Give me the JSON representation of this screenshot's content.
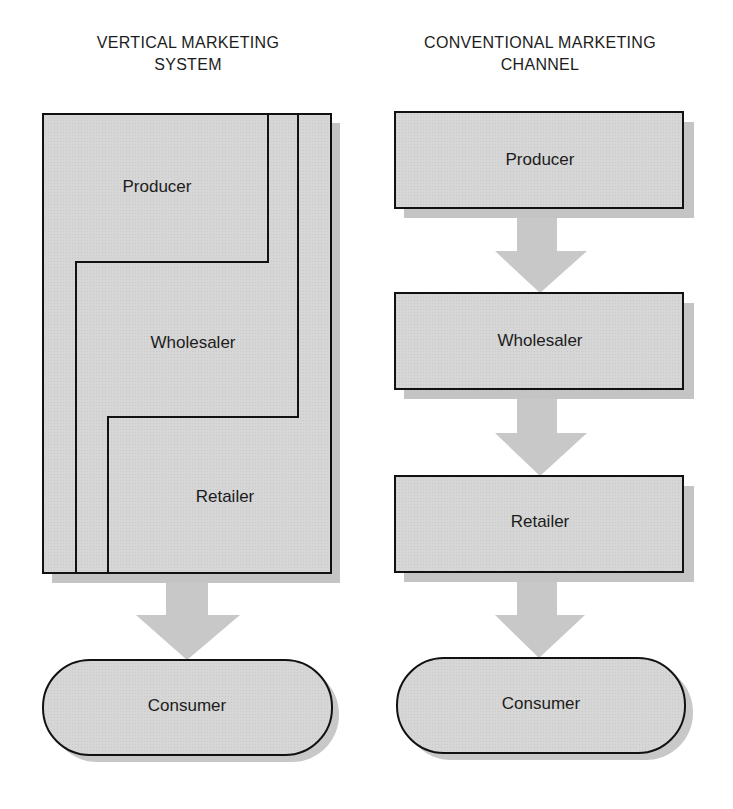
{
  "diagrams": {
    "vertical": {
      "title_line1": "VERTICAL MARKETING",
      "title_line2": "SYSTEM",
      "stages": [
        "Producer",
        "Wholesaler",
        "Retailer"
      ],
      "end": "Consumer"
    },
    "conventional": {
      "title_line1": "CONVENTIONAL MARKETING",
      "title_line2": "CHANNEL",
      "stages": [
        "Producer",
        "Wholesaler",
        "Retailer"
      ],
      "end": "Consumer"
    }
  },
  "colors": {
    "box_fill": "#d6d6d6",
    "shadow": "#c4c4c4",
    "arrow": "#c8c8c8",
    "stroke": "#111111",
    "background": "#ffffff"
  }
}
